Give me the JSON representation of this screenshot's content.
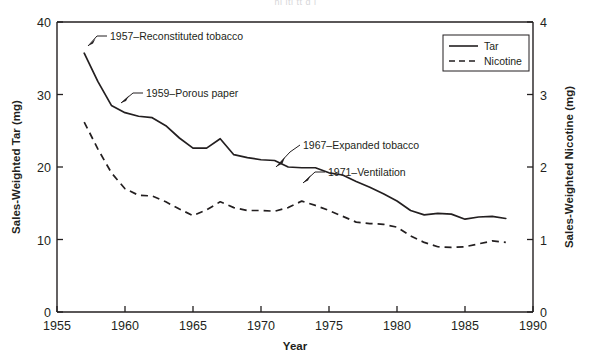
{
  "figure": {
    "background_color": "#ffffff",
    "ink_color": "#231f20",
    "cropped_header_text": "hi itl  tt  d  i"
  },
  "chart_data": {
    "type": "line",
    "title": "",
    "xlabel": "Year",
    "ylabel": "Sales-Weighted Tar (mg)",
    "y2label": "Sales-Weighted Nicotine (mg)",
    "xlim": [
      1955,
      1990
    ],
    "ylim": [
      0,
      40
    ],
    "y2lim": [
      0,
      4
    ],
    "xticks": [
      1955,
      1960,
      1965,
      1970,
      1975,
      1980,
      1985,
      1990
    ],
    "xtick_labels": [
      "1955",
      "1960",
      "1965",
      "1970",
      "1975",
      "1980",
      "1985",
      "1990"
    ],
    "yticks": [
      0,
      10,
      20,
      30,
      40
    ],
    "ytick_labels": [
      "0",
      "10",
      "20",
      "30",
      "40"
    ],
    "y2ticks": [
      0,
      1,
      2,
      3,
      4
    ],
    "y2tick_labels": [
      "0",
      "1",
      "2",
      "3",
      "4"
    ],
    "grid": false,
    "legend_position": "top-right",
    "x": [
      1957,
      1958,
      1959,
      1960,
      1961,
      1962,
      1963,
      1964,
      1965,
      1966,
      1967,
      1968,
      1969,
      1970,
      1971,
      1972,
      1973,
      1974,
      1975,
      1976,
      1977,
      1978,
      1979,
      1980,
      1981,
      1982,
      1983,
      1984,
      1985,
      1986,
      1987,
      1988
    ],
    "series": [
      {
        "name": "Tar",
        "axis": "left",
        "style": "solid",
        "units": "mg",
        "values": [
          35.7,
          31.8,
          28.5,
          27.5,
          27.0,
          26.8,
          25.7,
          24.0,
          22.6,
          22.6,
          23.9,
          21.7,
          21.3,
          21.0,
          20.9,
          20.0,
          19.9,
          19.9,
          19.2,
          18.9,
          18.0,
          17.2,
          16.3,
          15.3,
          14.0,
          13.4,
          13.6,
          13.5,
          12.8,
          13.1,
          13.2,
          12.9
        ]
      },
      {
        "name": "Nicotine",
        "axis": "right",
        "style": "dashed",
        "units": "mg",
        "values": [
          2.62,
          2.25,
          1.92,
          1.7,
          1.61,
          1.6,
          1.52,
          1.42,
          1.33,
          1.41,
          1.52,
          1.44,
          1.4,
          1.4,
          1.39,
          1.44,
          1.53,
          1.47,
          1.4,
          1.32,
          1.24,
          1.22,
          1.21,
          1.17,
          1.05,
          0.96,
          0.9,
          0.89,
          0.9,
          0.94,
          0.98,
          0.96
        ]
      }
    ],
    "annotations": [
      {
        "id": "reconstituted-tobacco",
        "label": "1957–Reconstituted tobacco",
        "year": 1957,
        "series": "Tar"
      },
      {
        "id": "porous-paper",
        "label": "1959–Porous paper",
        "year": 1959,
        "series": "Tar"
      },
      {
        "id": "expanded-tobacco",
        "label": "1967–Expanded tobacco",
        "year": 1967,
        "series": "Tar"
      },
      {
        "id": "ventilation",
        "label": "1971–Ventilation",
        "year": 1971,
        "series": "Tar"
      }
    ],
    "legend": [
      {
        "name": "Tar",
        "style": "solid"
      },
      {
        "name": "Nicotine",
        "style": "dashed"
      }
    ]
  }
}
